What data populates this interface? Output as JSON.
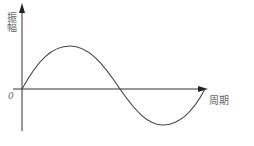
{
  "diagram": {
    "type": "sine-wave",
    "y_axis_label": "振幅",
    "x_axis_label": "周期",
    "origin_label": "0",
    "caption": "",
    "stroke_color": "#333333",
    "points": {
      "start": [
        22,
        89
      ],
      "peak": [
        70,
        46
      ],
      "mid_crossing": [
        120,
        89
      ],
      "trough": [
        163,
        125
      ],
      "end": [
        205,
        89
      ]
    }
  }
}
